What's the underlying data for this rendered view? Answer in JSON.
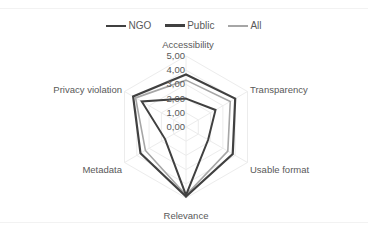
{
  "chart_data": {
    "type": "radar",
    "title": "",
    "categories": [
      "Accessibility",
      "Transparency",
      "Usable format",
      "Relevance",
      "Metadata",
      "Privacy violation"
    ],
    "series": [
      {
        "name": "NGO",
        "color": "#404040",
        "width": 2,
        "values": [
          2.0,
          2.4,
          1.8,
          4.8,
          1.7,
          3.6
        ]
      },
      {
        "name": "Public",
        "color": "#404040",
        "width": 2.2,
        "values": [
          3.7,
          4.0,
          3.8,
          4.9,
          3.7,
          4.3
        ]
      },
      {
        "name": "All",
        "color": "#a6a6a6",
        "width": 1.6,
        "values": [
          3.3,
          3.6,
          3.4,
          4.8,
          3.3,
          4.1
        ]
      }
    ],
    "rlim": [
      0,
      5
    ],
    "r_ticks": [
      "0,00",
      "1,00",
      "2,00",
      "3,00",
      "4,00",
      "5,00"
    ],
    "grid": true,
    "legend_position": "top"
  },
  "legend": {
    "items": [
      {
        "label": "NGO",
        "color": "#404040"
      },
      {
        "label": "Public",
        "color": "#404040"
      },
      {
        "label": "All",
        "color": "#a6a6a6"
      }
    ]
  }
}
